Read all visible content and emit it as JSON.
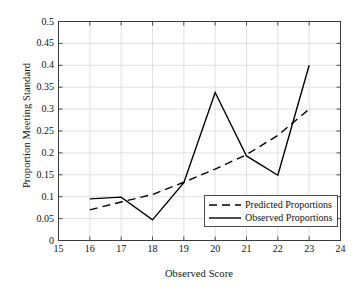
{
  "chart_data": {
    "type": "line",
    "title": "",
    "xlabel": "Observed Score",
    "ylabel": "Proportion Meeting Standard",
    "xlim": [
      15,
      24
    ],
    "ylim": [
      0,
      0.5
    ],
    "xticks": [
      "15",
      "16",
      "17",
      "18",
      "19",
      "20",
      "21",
      "22",
      "23",
      "24"
    ],
    "yticks": [
      "0",
      "0.05",
      "0.1",
      "0.15",
      "0.2",
      "0.25",
      "0.3",
      "0.35",
      "0.4",
      "0.45",
      "0.5"
    ],
    "grid": true,
    "legend_position": "lower right",
    "x": [
      16,
      17,
      18,
      19,
      20,
      21,
      22,
      23
    ],
    "series": [
      {
        "name": "Predicted Proportions",
        "style": "dashed",
        "color": "#000000",
        "values": [
          0.07,
          0.088,
          0.105,
          0.133,
          0.163,
          0.196,
          0.24,
          0.3
        ]
      },
      {
        "name": "Observed Proportions",
        "style": "solid",
        "color": "#000000",
        "values": [
          0.095,
          0.099,
          0.047,
          0.132,
          0.338,
          0.193,
          0.149,
          0.4
        ]
      }
    ]
  },
  "legend": {
    "items": [
      {
        "label": "Predicted Proportions"
      },
      {
        "label": "Observed Proportions"
      }
    ]
  }
}
